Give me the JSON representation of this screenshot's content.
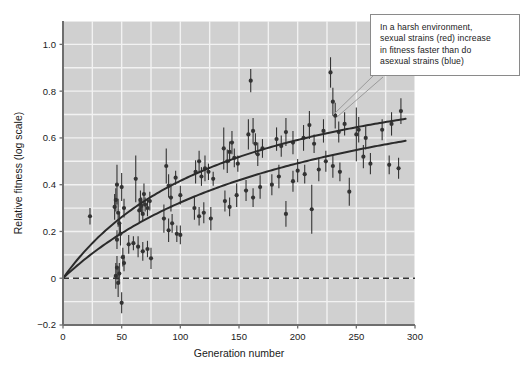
{
  "annotation": {
    "name": "callout-note",
    "lines": [
      "In a harsh environment,",
      "sexual strains (red) increase",
      "in fitness faster than do",
      "asexual strains (blue)"
    ],
    "full_text": "In a harsh environment, sexual strains (red) increase in fitness faster than do asexual strains (blue)"
  },
  "colors": {
    "plot_background": "#d0d0d0",
    "gridline": "#f2f2f2",
    "axis": "#6e6e6e",
    "point": "#333333",
    "curve": "#2b2b2b",
    "zero_line": "#333333",
    "callout_border": "#8a8a8a",
    "text": "#1a1a1a"
  },
  "chart_data": {
    "type": "scatter",
    "title": "",
    "xlabel": "Generation number",
    "ylabel": "Relative fitness (log scale)",
    "xlim": [
      0,
      300
    ],
    "ylim": [
      -0.2,
      1.1
    ],
    "xticks": [
      0,
      50,
      100,
      150,
      200,
      250,
      300
    ],
    "xtick_labels": [
      "0",
      "50",
      "100",
      "150",
      "200",
      "250",
      "300"
    ],
    "yticks": [
      -0.2,
      0,
      0.2,
      0.4,
      0.6,
      0.8,
      1.0
    ],
    "ytick_labels": [
      "−0.2",
      "0",
      "0.2",
      "0.4",
      "0.6",
      "0.8",
      "1.0"
    ],
    "grid": true,
    "grid_x_minor_step": 25,
    "grid_y_minor_step": 0.1,
    "legend": "none",
    "reference_lines": [
      {
        "name": "zero-fitness-line",
        "axis": "y",
        "value": 0,
        "style": "dashed"
      }
    ],
    "series": [
      {
        "name": "sexual strains",
        "color_described": "red",
        "fit_label": "upper fitted curve",
        "fit_type": "hyperbolic",
        "fit_params": {
          "a": 1.02,
          "b": 145
        },
        "points": [
          {
            "x": 23,
            "y": 0.265,
            "err": 0.035
          },
          {
            "x": 44,
            "y": 0.305,
            "err": 0.055
          },
          {
            "x": 45,
            "y": 0.335,
            "err": 0.05
          },
          {
            "x": 46,
            "y": 0.4,
            "err": 0.085
          },
          {
            "x": 46,
            "y": 0.165,
            "err": 0.04
          },
          {
            "x": 47,
            "y": 0.28,
            "err": 0.06
          },
          {
            "x": 48,
            "y": 0.235,
            "err": 0.045
          },
          {
            "x": 49,
            "y": 0.19,
            "err": 0.05
          },
          {
            "x": 50,
            "y": 0.39,
            "err": 0.06
          },
          {
            "x": 52,
            "y": 0.3,
            "err": 0.04
          },
          {
            "x": 62,
            "y": 0.425,
            "err": 0.1
          },
          {
            "x": 65,
            "y": 0.29,
            "err": 0.05
          },
          {
            "x": 66,
            "y": 0.335,
            "err": 0.04
          },
          {
            "x": 67,
            "y": 0.31,
            "err": 0.035
          },
          {
            "x": 68,
            "y": 0.275,
            "err": 0.03
          },
          {
            "x": 69,
            "y": 0.36,
            "err": 0.045
          },
          {
            "x": 70,
            "y": 0.315,
            "err": 0.03
          },
          {
            "x": 72,
            "y": 0.3,
            "err": 0.035
          },
          {
            "x": 74,
            "y": 0.33,
            "err": 0.04
          },
          {
            "x": 88,
            "y": 0.48,
            "err": 0.075
          },
          {
            "x": 90,
            "y": 0.395,
            "err": 0.05
          },
          {
            "x": 92,
            "y": 0.345,
            "err": 0.06
          },
          {
            "x": 96,
            "y": 0.43,
            "err": 0.03
          },
          {
            "x": 100,
            "y": 0.355,
            "err": 0.04
          },
          {
            "x": 113,
            "y": 0.455,
            "err": 0.05
          },
          {
            "x": 116,
            "y": 0.5,
            "err": 0.045
          },
          {
            "x": 118,
            "y": 0.435,
            "err": 0.04
          },
          {
            "x": 121,
            "y": 0.47,
            "err": 0.055
          },
          {
            "x": 124,
            "y": 0.455,
            "err": 0.035
          },
          {
            "x": 128,
            "y": 0.425,
            "err": 0.03
          },
          {
            "x": 137,
            "y": 0.555,
            "err": 0.09
          },
          {
            "x": 140,
            "y": 0.5,
            "err": 0.05
          },
          {
            "x": 142,
            "y": 0.54,
            "err": 0.045
          },
          {
            "x": 144,
            "y": 0.58,
            "err": 0.05
          },
          {
            "x": 146,
            "y": 0.515,
            "err": 0.04
          },
          {
            "x": 149,
            "y": 0.49,
            "err": 0.035
          },
          {
            "x": 158,
            "y": 0.615,
            "err": 0.065
          },
          {
            "x": 160,
            "y": 0.845,
            "err": 0.05
          },
          {
            "x": 162,
            "y": 0.63,
            "err": 0.055
          },
          {
            "x": 164,
            "y": 0.575,
            "err": 0.045
          },
          {
            "x": 166,
            "y": 0.53,
            "err": 0.05
          },
          {
            "x": 170,
            "y": 0.555,
            "err": 0.04
          },
          {
            "x": 182,
            "y": 0.595,
            "err": 0.05
          },
          {
            "x": 186,
            "y": 0.565,
            "err": 0.045
          },
          {
            "x": 190,
            "y": 0.625,
            "err": 0.06
          },
          {
            "x": 196,
            "y": 0.58,
            "err": 0.05
          },
          {
            "x": 205,
            "y": 0.6,
            "err": 0.055
          },
          {
            "x": 210,
            "y": 0.655,
            "err": 0.06
          },
          {
            "x": 214,
            "y": 0.575,
            "err": 0.04
          },
          {
            "x": 222,
            "y": 0.63,
            "err": 0.05
          },
          {
            "x": 228,
            "y": 0.88,
            "err": 0.065
          },
          {
            "x": 230,
            "y": 0.755,
            "err": 0.06
          },
          {
            "x": 232,
            "y": 0.695,
            "err": 0.055
          },
          {
            "x": 235,
            "y": 0.625,
            "err": 0.045
          },
          {
            "x": 240,
            "y": 0.66,
            "err": 0.05
          },
          {
            "x": 252,
            "y": 0.635,
            "err": 0.055
          },
          {
            "x": 258,
            "y": 0.6,
            "err": 0.05
          },
          {
            "x": 272,
            "y": 0.635,
            "err": 0.045
          },
          {
            "x": 280,
            "y": 0.66,
            "err": 0.05
          },
          {
            "x": 288,
            "y": 0.715,
            "err": 0.055
          }
        ]
      },
      {
        "name": "asexual strains",
        "color_described": "blue",
        "fit_label": "lower fitted curve",
        "fit_type": "hyperbolic",
        "fit_params": {
          "a": 1.02,
          "b": 215
        },
        "points": [
          {
            "x": 45,
            "y": 0.01,
            "err": 0.055
          },
          {
            "x": 46,
            "y": 0.045,
            "err": 0.05
          },
          {
            "x": 47,
            "y": -0.02,
            "err": 0.06
          },
          {
            "x": 48,
            "y": 0.02,
            "err": 0.045
          },
          {
            "x": 50,
            "y": -0.105,
            "err": 0.045
          },
          {
            "x": 51,
            "y": 0.09,
            "err": 0.04
          },
          {
            "x": 52,
            "y": 0.065,
            "err": 0.035
          },
          {
            "x": 56,
            "y": 0.145,
            "err": 0.04
          },
          {
            "x": 60,
            "y": 0.15,
            "err": 0.03
          },
          {
            "x": 64,
            "y": 0.135,
            "err": 0.045
          },
          {
            "x": 68,
            "y": 0.115,
            "err": 0.04
          },
          {
            "x": 72,
            "y": 0.125,
            "err": 0.035
          },
          {
            "x": 75,
            "y": 0.085,
            "err": 0.045
          },
          {
            "x": 86,
            "y": 0.255,
            "err": 0.06
          },
          {
            "x": 90,
            "y": 0.205,
            "err": 0.05
          },
          {
            "x": 93,
            "y": 0.235,
            "err": 0.04
          },
          {
            "x": 97,
            "y": 0.19,
            "err": 0.035
          },
          {
            "x": 100,
            "y": 0.185,
            "err": 0.04
          },
          {
            "x": 112,
            "y": 0.3,
            "err": 0.05
          },
          {
            "x": 116,
            "y": 0.265,
            "err": 0.04
          },
          {
            "x": 120,
            "y": 0.28,
            "err": 0.045
          },
          {
            "x": 126,
            "y": 0.255,
            "err": 0.05
          },
          {
            "x": 138,
            "y": 0.33,
            "err": 0.045
          },
          {
            "x": 142,
            "y": 0.305,
            "err": 0.04
          },
          {
            "x": 148,
            "y": 0.355,
            "err": 0.05
          },
          {
            "x": 156,
            "y": 0.375,
            "err": 0.045
          },
          {
            "x": 162,
            "y": 0.345,
            "err": 0.04
          },
          {
            "x": 168,
            "y": 0.39,
            "err": 0.05
          },
          {
            "x": 178,
            "y": 0.4,
            "err": 0.045
          },
          {
            "x": 184,
            "y": 0.435,
            "err": 0.05
          },
          {
            "x": 190,
            "y": 0.275,
            "err": 0.055
          },
          {
            "x": 196,
            "y": 0.415,
            "err": 0.045
          },
          {
            "x": 200,
            "y": 0.46,
            "err": 0.05
          },
          {
            "x": 206,
            "y": 0.445,
            "err": 0.04
          },
          {
            "x": 212,
            "y": 0.295,
            "err": 0.105
          },
          {
            "x": 218,
            "y": 0.465,
            "err": 0.05
          },
          {
            "x": 224,
            "y": 0.5,
            "err": 0.045
          },
          {
            "x": 230,
            "y": 0.48,
            "err": 0.05
          },
          {
            "x": 236,
            "y": 0.455,
            "err": 0.04
          },
          {
            "x": 244,
            "y": 0.37,
            "err": 0.06
          },
          {
            "x": 250,
            "y": 0.615,
            "err": 0.115
          },
          {
            "x": 256,
            "y": 0.52,
            "err": 0.05
          },
          {
            "x": 262,
            "y": 0.49,
            "err": 0.045
          },
          {
            "x": 278,
            "y": 0.485,
            "err": 0.04
          },
          {
            "x": 286,
            "y": 0.47,
            "err": 0.045
          }
        ]
      }
    ]
  }
}
